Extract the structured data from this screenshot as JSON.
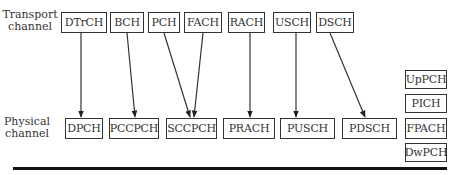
{
  "labels": {
    "transport": "Transport\nchannel",
    "transport_line1": "Transport",
    "transport_line2": "channel",
    "physical_line1": "Physical",
    "physical_line2": "channel"
  },
  "transport_channels": [
    {
      "id": "dtrch",
      "label": "DTrCH",
      "x": 61,
      "w": 46
    },
    {
      "id": "bch",
      "label": "BCH",
      "x": 110,
      "w": 34
    },
    {
      "id": "pch",
      "label": "PCH",
      "x": 148,
      "w": 32
    },
    {
      "id": "fach",
      "label": "FACH",
      "x": 184,
      "w": 38
    },
    {
      "id": "rach",
      "label": "RACH",
      "x": 228,
      "w": 37
    },
    {
      "id": "usch",
      "label": "USCH",
      "x": 273,
      "w": 38
    },
    {
      "id": "dsch",
      "label": "DSCH",
      "x": 316,
      "w": 38
    }
  ],
  "physical_channels": [
    {
      "id": "dpch",
      "label": "DPCH",
      "x": 65,
      "w": 38
    },
    {
      "id": "pccpch",
      "label": "PCCPCH",
      "x": 109,
      "w": 50
    },
    {
      "id": "sccpch",
      "label": "SCCPCH",
      "x": 166,
      "w": 51
    },
    {
      "id": "prach",
      "label": "PRACH",
      "x": 223,
      "w": 52
    },
    {
      "id": "pusch",
      "label": "PUSCH",
      "x": 280,
      "w": 55
    },
    {
      "id": "pdsch",
      "label": "PDSCH",
      "x": 342,
      "w": 55
    }
  ],
  "standalone_physical_channels": [
    {
      "id": "uppch",
      "label": "UpPCH",
      "y": 70
    },
    {
      "id": "pich",
      "label": "PICH",
      "y": 94
    },
    {
      "id": "fpach",
      "label": "FPACH",
      "y": 118
    },
    {
      "id": "dwpch",
      "label": "DwPCH",
      "y": 143
    }
  ],
  "mappings": [
    {
      "from": "DTrCH",
      "to": "DPCH"
    },
    {
      "from": "BCH",
      "to": "PCCPCH"
    },
    {
      "from": "PCH",
      "to": "SCCPCH"
    },
    {
      "from": "FACH",
      "to": "SCCPCH"
    },
    {
      "from": "RACH",
      "to": "PRACH"
    },
    {
      "from": "USCH",
      "to": "PUSCH"
    },
    {
      "from": "DSCH",
      "to": "PDSCH"
    }
  ]
}
